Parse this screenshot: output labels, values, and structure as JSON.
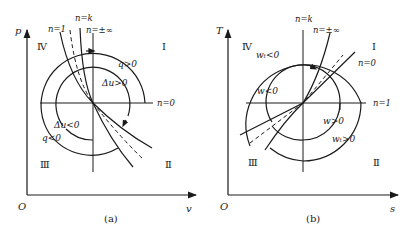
{
  "panels": [
    {
      "id": "a",
      "caption": "(a)",
      "axes": {
        "y_label": "p",
        "x_label": "v",
        "origin_label": "O"
      },
      "quadrants": {
        "q1": "Ⅰ",
        "q2": "Ⅱ",
        "q3": "Ⅲ",
        "q4": "Ⅳ"
      },
      "curve_labels": {
        "n1": "n=1",
        "nk": "n=k",
        "ninf": "n=±∞",
        "n0": "n=0"
      },
      "region_labels": {
        "outer_pos": "q>0",
        "inner_pos": "Δu>0",
        "inner_neg": "Δu<0",
        "outer_neg": "q<0"
      }
    },
    {
      "id": "b",
      "caption": "(b)",
      "axes": {
        "y_label": "T",
        "x_label": "s",
        "origin_label": "O"
      },
      "quadrants": {
        "q1": "Ⅰ",
        "q2": "Ⅱ",
        "q3": "Ⅲ",
        "q4": "Ⅳ"
      },
      "curve_labels": {
        "nk": "n=k",
        "ninf": "n=±∞",
        "n0": "n=0",
        "n1": "n=1"
      },
      "region_labels": {
        "outer_neg": "wₜ<0",
        "inner_neg": "w<0",
        "inner_pos": "w>0",
        "outer_pos": "wₜ>0"
      }
    }
  ],
  "colors": {
    "line": "#1a1a1a",
    "background": "#ffffff"
  }
}
